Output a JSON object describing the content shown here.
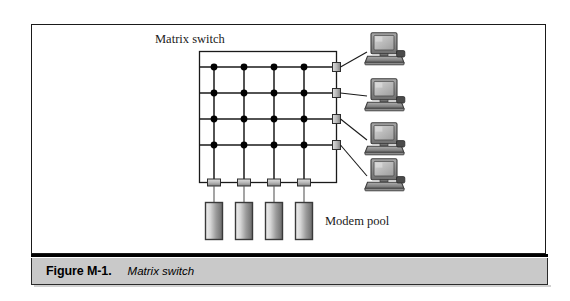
{
  "figure": {
    "caption_number": "Figure M-1.",
    "caption_title": "Matrix switch",
    "labels": {
      "matrix_switch": "Matrix switch",
      "modem_pool": "Modem pool"
    }
  },
  "colors": {
    "page_background": "#ffffff",
    "frame_border": "#1a1a1a",
    "caption_bar_background": "#c9c9c9",
    "caption_rule": "#000000",
    "line": "#1a1a1a",
    "crosspoint_dot": "#000000",
    "connector_fill_light": "#cfcfcf",
    "connector_fill_dark": "#8a8a8a",
    "modem_fill_light": "#e3e3e3",
    "modem_fill_dark": "#6f6f6f",
    "modem_border": "#3a3a3a",
    "monitor_bezel": "#8f8f8f",
    "monitor_screen": "#bdbdbd",
    "computer_base": "#777777"
  },
  "diagram": {
    "type": "network-schematic",
    "switch_box": {
      "label": "Matrix switch",
      "x": 168,
      "y": 27,
      "width": 138,
      "height": 132
    },
    "matrix": {
      "rows": 4,
      "columns": 4,
      "crosspoints": 16,
      "row_y": [
        43,
        69,
        95,
        121
      ],
      "column_x": [
        183,
        213,
        243,
        273
      ],
      "description": "4 horizontal buses crossed by 4 vertical buses with a dot at every intersection"
    },
    "right_ports": {
      "count": 4,
      "label": "ports to terminals",
      "y": [
        43,
        69,
        95,
        121
      ]
    },
    "bottom_ports": {
      "count": 4,
      "label": "ports to modems",
      "x": [
        183,
        213,
        243,
        273
      ]
    },
    "computers": {
      "count": 4,
      "label": "terminals",
      "positions": [
        {
          "x": 330,
          "y": 10
        },
        {
          "x": 330,
          "y": 56
        },
        {
          "x": 330,
          "y": 100
        },
        {
          "x": 330,
          "y": 138
        }
      ]
    },
    "modems": {
      "count": 4,
      "label": "Modem pool",
      "positions": [
        {
          "x": 176,
          "y": 176
        },
        {
          "x": 206,
          "y": 176
        },
        {
          "x": 236,
          "y": 176
        },
        {
          "x": 266,
          "y": 176
        }
      ]
    }
  }
}
